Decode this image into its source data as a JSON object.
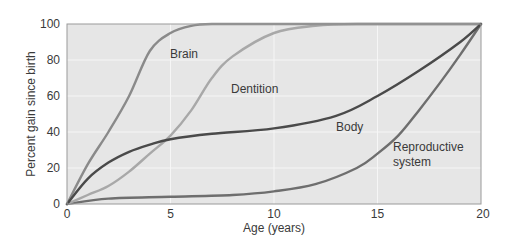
{
  "chart_data": {
    "type": "line",
    "title": "",
    "xlabel": "Age (years)",
    "ylabel": "Percent gain since birth",
    "xlim": [
      0,
      20
    ],
    "ylim": [
      0,
      100
    ],
    "x_ticks": [
      0,
      5,
      10,
      15,
      20
    ],
    "y_ticks": [
      0,
      20,
      40,
      60,
      80,
      100
    ],
    "grid": true,
    "legend": "inline labels",
    "series": [
      {
        "name": "Brain",
        "color": "#8a8a8a",
        "x": [
          0,
          1,
          2,
          3,
          4,
          5,
          6,
          7,
          10,
          15,
          20
        ],
        "values": [
          0,
          22,
          40,
          60,
          85,
          95,
          99,
          100,
          100,
          100,
          100
        ],
        "label_pos": [
          5.2,
          84
        ]
      },
      {
        "name": "Dentition",
        "color": "#a8a8a8",
        "x": [
          0,
          1,
          2,
          3,
          4,
          5,
          6,
          7,
          8,
          10,
          12,
          14,
          20
        ],
        "values": [
          0,
          5,
          10,
          18,
          28,
          38,
          52,
          70,
          82,
          95,
          99,
          100,
          100
        ],
        "label_pos": [
          7.1,
          64
        ]
      },
      {
        "name": "Body",
        "color": "#4a4a4a",
        "x": [
          0,
          1,
          2,
          3,
          4,
          5,
          7,
          10,
          13,
          15,
          17,
          19,
          20
        ],
        "values": [
          0,
          14,
          23,
          29,
          33,
          36,
          39,
          42,
          49,
          60,
          74,
          90,
          100
        ],
        "label_pos": [
          12.1,
          38
        ]
      },
      {
        "name": "Reproductive system",
        "color": "#6e6e6e",
        "x": [
          0,
          2,
          5,
          8,
          10,
          12,
          14,
          15,
          16,
          17,
          18,
          19,
          20
        ],
        "values": [
          0,
          3,
          4,
          5,
          7,
          11,
          20,
          28,
          38,
          52,
          67,
          83,
          100
        ],
        "label_pos": [
          15.0,
          28
        ]
      }
    ]
  },
  "labels": {
    "brain": "Brain",
    "dentition": "Dentition",
    "body": "Body",
    "reproductive_line1": "Reproductive",
    "reproductive_line2": "system"
  },
  "axes": {
    "xlabel": "Age (years)",
    "ylabel": "Percent gain since birth",
    "x_tick_labels": [
      "0",
      "5",
      "10",
      "15",
      "20"
    ],
    "y_tick_labels": [
      "0",
      "20",
      "40",
      "60",
      "80",
      "100"
    ]
  }
}
